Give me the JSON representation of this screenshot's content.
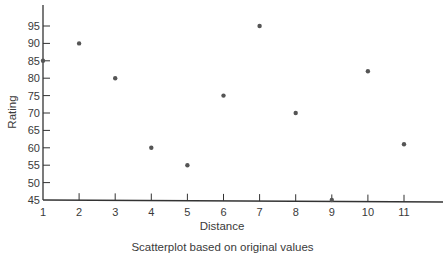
{
  "chart_data": {
    "type": "scatter",
    "title": "",
    "xlabel": "Distance",
    "ylabel": "Rating",
    "caption": "Scatterplot based on original values",
    "x": [
      1,
      2,
      3,
      4,
      5,
      6,
      7,
      8,
      9,
      10,
      11
    ],
    "y": [
      85,
      90,
      80,
      60,
      55,
      75,
      95,
      70,
      45,
      82,
      61
    ],
    "xlim": [
      1,
      12
    ],
    "ylim": [
      45,
      100
    ],
    "xticks": [
      1,
      2,
      3,
      4,
      5,
      6,
      7,
      8,
      9,
      10,
      11
    ],
    "yticks": [
      45,
      50,
      55,
      60,
      65,
      70,
      75,
      80,
      85,
      90,
      95
    ],
    "grid": false,
    "legend": null,
    "marker_color": "#555555",
    "axis_color": "#333333"
  }
}
